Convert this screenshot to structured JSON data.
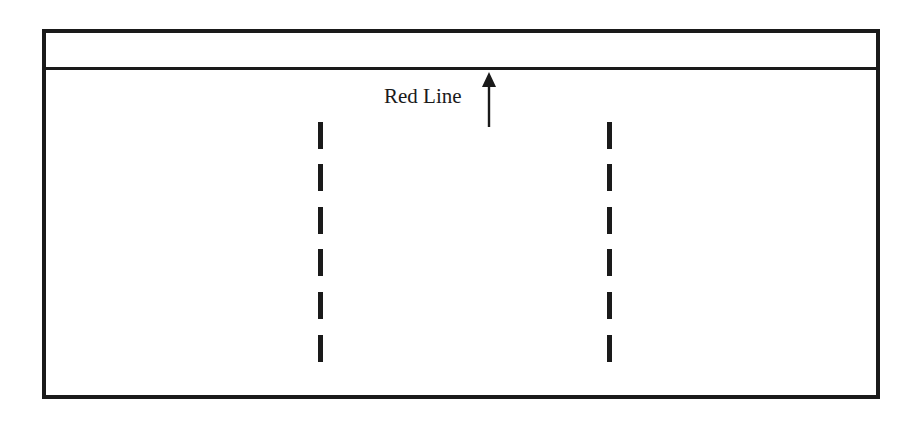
{
  "diagram": {
    "annotation": {
      "label": "Red Line",
      "icon": "arrow-up-icon"
    },
    "frame": {
      "border_color": "#1a1a1a",
      "background": "#ffffff"
    },
    "dashed_lines": [
      {
        "name": "left-dashed-line",
        "x": 318,
        "dash_count": 6
      },
      {
        "name": "right-dashed-line",
        "x": 607,
        "dash_count": 6
      }
    ]
  }
}
